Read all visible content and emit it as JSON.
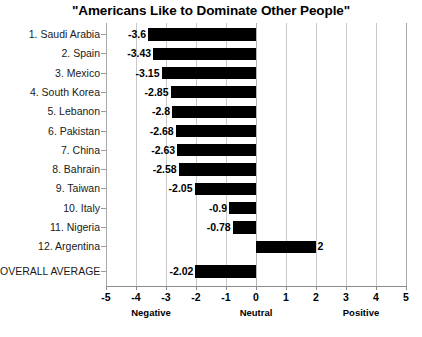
{
  "chart_data": {
    "type": "bar",
    "orientation": "horizontal",
    "title": "\"Americans Like to Dominate Other People\"",
    "xlabel": "",
    "ylabel": "",
    "xlim": [
      -5,
      5
    ],
    "grid": true,
    "legend": null,
    "categories": [
      "1. Saudi Arabia",
      "2. Spain",
      "3. Mexico",
      "4. South Korea",
      "5. Lebanon",
      "6. Pakistan",
      "7. China",
      "8. Bahrain",
      "9. Taiwan",
      "10. Italy",
      "11. Nigeria",
      "12. Argentina",
      "OVERALL AVERAGE"
    ],
    "values": [
      -3.6,
      -3.43,
      -3.15,
      -2.85,
      -2.8,
      -2.68,
      -2.63,
      -2.58,
      -2.05,
      -0.9,
      -0.78,
      2,
      -2.02
    ],
    "value_labels": [
      "-3.6",
      "-3.43",
      "-3.15",
      "-2.85",
      "-2.8",
      "-2.68",
      "-2.63",
      "-2.58",
      "-2.05",
      "-0.9",
      "-0.78",
      "2",
      "-2.02"
    ],
    "bar_color": "#000000",
    "gridline_color": "#c9c9c9",
    "xticks": [
      -5,
      -4,
      -3,
      -2,
      -1,
      0,
      1,
      2,
      3,
      4,
      5
    ],
    "xtick_labels": [
      "-5",
      "-4",
      "-3",
      "-2",
      "-1",
      "0",
      "1",
      "2",
      "3",
      "4",
      "5"
    ],
    "zone_labels": [
      {
        "text": "Negative",
        "at": -3.5
      },
      {
        "text": "Neutral",
        "at": 0
      },
      {
        "text": "Positive",
        "at": 3.5
      }
    ]
  }
}
